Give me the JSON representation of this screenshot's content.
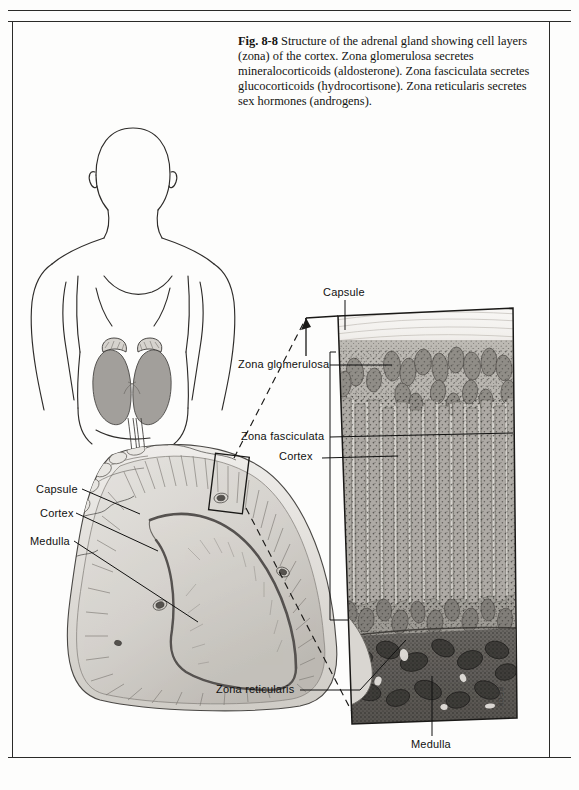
{
  "figure": {
    "number": "Fig. 8-8",
    "caption_runs": [
      {
        "text": "Fig. 8-8",
        "bold": true
      },
      {
        "text": " Structure of the adrenal gland showing cell layers (zona) of the cortex. Zona glomerulosa secretes mineralocorticoids (aldosterone). Zona fasciculata secretes glucocorticoids (hydrocortisone). Zona reticularis secretes sex hormones (androgens).",
        "bold": false
      }
    ],
    "caption_full": "Fig. 8-8 Structure of the adrenal gland showing cell layers (zona) of the cortex. Zona glomerulosa secretes mineralocorticoids (aldosterone). Zona fasciculata secretes glucocorticoids (hydrocortisone). Zona reticularis secretes sex hormones (androgens).",
    "artist_credit": "BECK"
  },
  "panels": {
    "body_diagram": {
      "name": "human-torso-with-kidneys",
      "description": "Outline drawing of human head and torso with paired kidneys and adrenal glands shaded gray"
    },
    "gross_section": {
      "name": "adrenal-gland-cross-section",
      "description": "Chevron-shaped gross cross-section of adrenal gland showing capsule, cortex and medulla"
    },
    "histology": {
      "name": "adrenal-cortex-histology",
      "description": "Magnified trapezoidal histology panel showing capsule, zona glomerulosa, zona fasciculata, zona reticularis and medulla"
    }
  },
  "labels": {
    "gross": [
      {
        "id": "capsule",
        "text": "Capsule"
      },
      {
        "id": "cortex",
        "text": "Cortex"
      },
      {
        "id": "medulla",
        "text": "Medulla"
      }
    ],
    "histology": [
      {
        "id": "capsule",
        "text": "Capsule"
      },
      {
        "id": "zona-glomerulosa",
        "text": "Zona glomerulosa"
      },
      {
        "id": "zona-fasciculata",
        "text": "Zona fasciculata"
      },
      {
        "id": "cortex",
        "text": "Cortex"
      },
      {
        "id": "zona-reticularis",
        "text": "Zona reticularis"
      },
      {
        "id": "medulla",
        "text": "Medulla"
      }
    ]
  },
  "colors": {
    "ink": "#111110",
    "page": "#fdfdfc",
    "rule": "#2a2a28",
    "tissue_light": "#d8d6d2",
    "tissue_mid": "#a9a6a0",
    "tissue_dark": "#6e6b66",
    "medulla_dark": "#4a4845",
    "organ_gray": "#9b9893"
  }
}
